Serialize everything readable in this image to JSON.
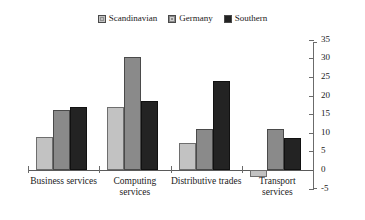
{
  "chart_data": {
    "type": "bar",
    "title": "",
    "subtitle": "",
    "xlabel": "",
    "ylabel": "",
    "ylim": [
      -5,
      35
    ],
    "yticks": [
      -5,
      0,
      5,
      10,
      15,
      20,
      25,
      30,
      35
    ],
    "ytick_labels": [
      "-5",
      "0",
      "5",
      "10",
      "15",
      "20",
      "25",
      "30",
      "35"
    ],
    "y_axis_position": "right",
    "grid": false,
    "legend_position": "top-center",
    "categories": [
      "Business services",
      "Computing\nservices",
      "Distributive trades",
      "Transport\nservices"
    ],
    "series": [
      {
        "name": "Scandinavian",
        "color": "#c2c2c2",
        "values": [
          9,
          17,
          7.3,
          -2
        ]
      },
      {
        "name": "Germany",
        "color": "#8a8a8a",
        "values": [
          16,
          30.5,
          11,
          11
        ]
      },
      {
        "name": "Southern",
        "color": "#232323",
        "values": [
          17,
          18.5,
          24,
          8.5
        ]
      }
    ]
  },
  "legend": {
    "items": [
      {
        "label": "Scandinavian",
        "swatch": "legend-swatch-scandinavian"
      },
      {
        "label": "Germany",
        "swatch": "legend-swatch-germany"
      },
      {
        "label": "Southern",
        "swatch": "legend-swatch-southern"
      }
    ]
  }
}
